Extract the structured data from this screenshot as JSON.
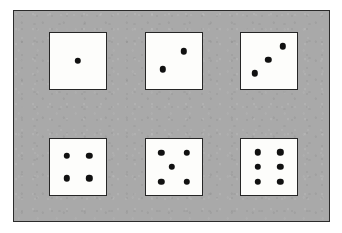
{
  "figure": {
    "canvas": {
      "width": 342,
      "height": 233,
      "background": "#ffffff"
    },
    "panel": {
      "fill": "#a9a9a9",
      "border_color": "#2b2b2b",
      "x": 13,
      "y": 10,
      "width": 317,
      "height": 212
    },
    "die_style": {
      "face_color": "#fdfdfb",
      "border_color": "#262626",
      "pip_color": "#111111",
      "size": 58,
      "pip_diameter": 6.4
    },
    "rows": 2,
    "columns": 3
  },
  "dice": [
    {
      "name": "die-one",
      "value": 1,
      "row": 1,
      "column": 1,
      "x": 48,
      "y": 31,
      "arrangement": "single-center",
      "pips": [
        {
          "cx": 50,
          "cy": 50
        }
      ]
    },
    {
      "name": "die-two",
      "value": 2,
      "row": 1,
      "column": 2,
      "x": 144,
      "y": 31,
      "arrangement": "diagonal-bottom-left-to-top-right",
      "pips": [
        {
          "cx": 30,
          "cy": 65
        },
        {
          "cx": 68,
          "cy": 33
        }
      ]
    },
    {
      "name": "die-three",
      "value": 3,
      "row": 1,
      "column": 3,
      "x": 239,
      "y": 31,
      "arrangement": "diagonal-three",
      "pips": [
        {
          "cx": 25,
          "cy": 72
        },
        {
          "cx": 49,
          "cy": 48
        },
        {
          "cx": 75,
          "cy": 24
        }
      ]
    },
    {
      "name": "die-four",
      "value": 4,
      "row": 2,
      "column": 1,
      "x": 48,
      "y": 137,
      "arrangement": "four-corners",
      "pips": [
        {
          "cx": 30,
          "cy": 30
        },
        {
          "cx": 70,
          "cy": 30
        },
        {
          "cx": 30,
          "cy": 70
        },
        {
          "cx": 70,
          "cy": 70
        }
      ]
    },
    {
      "name": "die-five",
      "value": 5,
      "row": 2,
      "column": 2,
      "x": 144,
      "y": 137,
      "arrangement": "four-corners-plus-center",
      "pips": [
        {
          "cx": 27,
          "cy": 25
        },
        {
          "cx": 73,
          "cy": 25
        },
        {
          "cx": 46,
          "cy": 50
        },
        {
          "cx": 27,
          "cy": 76
        },
        {
          "cx": 73,
          "cy": 76
        }
      ]
    },
    {
      "name": "die-six",
      "value": 6,
      "row": 2,
      "column": 3,
      "x": 239,
      "y": 137,
      "arrangement": "two-columns-of-three",
      "pips": [
        {
          "cx": 30,
          "cy": 24
        },
        {
          "cx": 70,
          "cy": 24
        },
        {
          "cx": 30,
          "cy": 50
        },
        {
          "cx": 70,
          "cy": 50
        },
        {
          "cx": 30,
          "cy": 76
        },
        {
          "cx": 70,
          "cy": 76
        }
      ]
    }
  ]
}
